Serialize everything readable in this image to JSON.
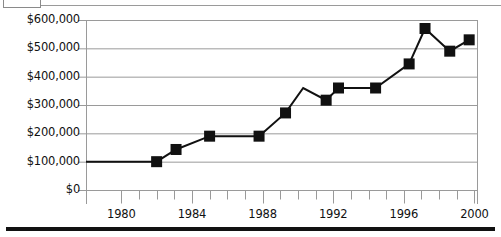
{
  "chart_data": {
    "type": "line",
    "title": "",
    "subtitle": "",
    "xlabel": "",
    "ylabel": "",
    "xlim": [
      1978,
      2000.2
    ],
    "ylim": [
      0,
      600000
    ],
    "grid": true,
    "legend_position": "none",
    "marker": "filled-square",
    "line_color": "#111111",
    "marker_color": "#111111",
    "grid_color": "#9a9a9a",
    "y_ticks": [
      0,
      100000,
      200000,
      300000,
      400000,
      500000,
      600000
    ],
    "y_tick_labels": [
      "$0",
      "$100,000",
      "$200,000",
      "$300,000",
      "$400,000",
      "$500,000",
      "$600,000"
    ],
    "x_ticks": [
      1980,
      1981,
      1982,
      1983,
      1984,
      1985,
      1986,
      1987,
      1988,
      1989,
      1990,
      1991,
      1992,
      1993,
      1994,
      1995,
      1996,
      1997,
      1998,
      1999,
      2000
    ],
    "x_tick_labels_shown": [
      "1980",
      "1984",
      "1988",
      "1992",
      "1996",
      "2000"
    ],
    "x_labeled_ticks": [
      1980,
      1984,
      1988,
      1992,
      1996,
      2000
    ],
    "series": [
      {
        "name": "Value",
        "points": [
          {
            "x": 1978.0,
            "y": 100000,
            "marker": false
          },
          {
            "x": 1982.0,
            "y": 100000,
            "marker": true
          },
          {
            "x": 1983.1,
            "y": 143000,
            "marker": true
          },
          {
            "x": 1985.0,
            "y": 190000,
            "marker": true
          },
          {
            "x": 1987.8,
            "y": 190000,
            "marker": true
          },
          {
            "x": 1989.3,
            "y": 272000,
            "marker": true
          },
          {
            "x": 1990.3,
            "y": 360000,
            "marker": false
          },
          {
            "x": 1991.6,
            "y": 317000,
            "marker": true
          },
          {
            "x": 1992.3,
            "y": 360000,
            "marker": true
          },
          {
            "x": 1994.4,
            "y": 360000,
            "marker": true
          },
          {
            "x": 1996.3,
            "y": 445000,
            "marker": true
          },
          {
            "x": 1997.2,
            "y": 570000,
            "marker": true
          },
          {
            "x": 1998.6,
            "y": 490000,
            "marker": true
          },
          {
            "x": 1999.7,
            "y": 530000,
            "marker": true
          }
        ]
      }
    ]
  },
  "axes": {
    "y_labels": [
      {
        "text": "$600,000",
        "value": 600000
      },
      {
        "text": "$500,000",
        "value": 500000
      },
      {
        "text": "$400,000",
        "value": 400000
      },
      {
        "text": "$300,000",
        "value": 300000
      },
      {
        "text": "$200,000",
        "value": 200000
      },
      {
        "text": "$100,000",
        "value": 100000
      },
      {
        "text": "$0",
        "value": 0
      }
    ],
    "x_labels": [
      {
        "text": "1980",
        "value": 1980
      },
      {
        "text": "1984",
        "value": 1984
      },
      {
        "text": "1988",
        "value": 1988
      },
      {
        "text": "1992",
        "value": 1992
      },
      {
        "text": "1996",
        "value": 1996
      },
      {
        "text": "2000",
        "value": 2000
      }
    ]
  },
  "decor": {
    "top_box_label": "",
    "bottom_rule_color": "#111111"
  }
}
